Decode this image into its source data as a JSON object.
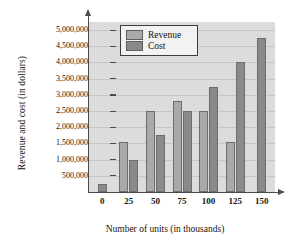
{
  "chart_data": {
    "type": "bar",
    "title": "",
    "xlabel": "Number of units (in thousands)",
    "ylabel": "Revenue and cost (in dollars)",
    "categories": [
      "0",
      "25",
      "50",
      "75",
      "100",
      "125",
      "150"
    ],
    "series": [
      {
        "name": "Revenue",
        "values": [
          null,
          1550000,
          2500000,
          2800000,
          2500000,
          1550000,
          null
        ],
        "color": "#a9a9a9"
      },
      {
        "name": "Cost",
        "values": [
          250000,
          1000000,
          1750000,
          2500000,
          3250000,
          4000000,
          4750000
        ],
        "color": "#8a8a8a"
      }
    ],
    "ylim": [
      0,
      5250000
    ],
    "ytick_values": [
      500000,
      1000000,
      1500000,
      2000000,
      2500000,
      3000000,
      3500000,
      4000000,
      4500000,
      5000000
    ],
    "ytick_labels": [
      "500,000",
      "1,000,000",
      "1,500,000",
      "2,000,000",
      "2,500,000",
      "3,000,000",
      "3,500,000",
      "4,000,000",
      "4,500,000",
      "5,000,000"
    ],
    "grid": true,
    "legend_position": "top-left",
    "plot_background": "#dcdcdc"
  },
  "legend": {
    "entries": [
      {
        "label": "Revenue"
      },
      {
        "label": "Cost"
      }
    ]
  }
}
